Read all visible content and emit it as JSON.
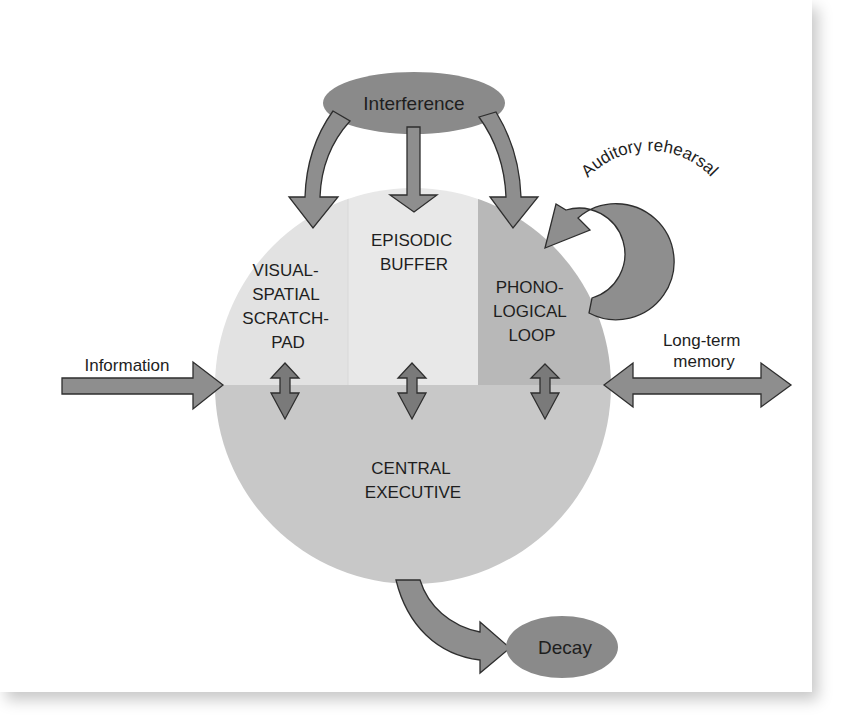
{
  "diagram": {
    "colors": {
      "arrow_fill": "#8e8e8e",
      "arrow_stroke": "#2e2e2e",
      "ellipse_fill": "#8a8a8a",
      "visual_spatial_fill": "#e2e2e2",
      "episodic_buffer_fill": "#e8e8e8",
      "phonological_loop_fill": "#b8b8b8",
      "central_executive_fill": "#c8c8c8",
      "text": "#1e1e1e"
    },
    "nodes": {
      "interference": {
        "label": "Interference"
      },
      "decay": {
        "label": "Decay"
      },
      "visual_spatial": {
        "lines": [
          "VISUAL-",
          "SPATIAL",
          "SCRATCH-",
          "PAD"
        ]
      },
      "episodic_buffer": {
        "lines": [
          "EPISODIC",
          "BUFFER"
        ]
      },
      "phonological_loop": {
        "lines": [
          "PHONO-",
          "LOGICAL",
          "LOOP"
        ]
      },
      "central_executive": {
        "lines": [
          "CENTRAL",
          "EXECUTIVE"
        ]
      }
    },
    "edge_labels": {
      "information": "Information",
      "long_term_memory": [
        "Long-term",
        "memory"
      ],
      "auditory_rehearsal": "Auditory rehearsal"
    },
    "edges": [
      {
        "from": "Interference",
        "to": "VISUAL-SPATIAL SCRATCH-PAD",
        "type": "curved-arrow"
      },
      {
        "from": "Interference",
        "to": "EPISODIC BUFFER",
        "type": "arrow"
      },
      {
        "from": "Interference",
        "to": "PHONOLOGICAL LOOP",
        "type": "curved-arrow"
      },
      {
        "from": "PHONOLOGICAL LOOP",
        "to": "PHONOLOGICAL LOOP",
        "label": "Auditory rehearsal",
        "type": "loop-arrow"
      },
      {
        "from": "Information",
        "to": "CENTRAL EXECUTIVE",
        "type": "arrow"
      },
      {
        "from": "CENTRAL EXECUTIVE",
        "to": "Long-term memory",
        "type": "double-arrow"
      },
      {
        "from": "VISUAL-SPATIAL SCRATCH-PAD",
        "to": "CENTRAL EXECUTIVE",
        "type": "double-arrow"
      },
      {
        "from": "EPISODIC BUFFER",
        "to": "CENTRAL EXECUTIVE",
        "type": "double-arrow"
      },
      {
        "from": "PHONOLOGICAL LOOP",
        "to": "CENTRAL EXECUTIVE",
        "type": "double-arrow"
      },
      {
        "from": "CENTRAL EXECUTIVE",
        "to": "Decay",
        "type": "curved-arrow"
      }
    ]
  }
}
